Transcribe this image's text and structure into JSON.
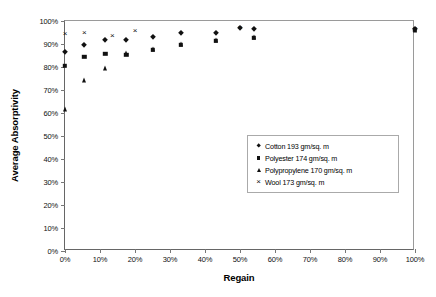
{
  "chart_data": {
    "type": "scatter",
    "title": "",
    "xlabel": "Regain",
    "ylabel": "Average Absorptivity",
    "xlim": [
      0,
      100
    ],
    "ylim": [
      0,
      100
    ],
    "xticks": [
      "0%",
      "10%",
      "20%",
      "30%",
      "40%",
      "50%",
      "60%",
      "70%",
      "80%",
      "90%",
      "100%"
    ],
    "yticks": [
      "0%",
      "10%",
      "20%",
      "30%",
      "40%",
      "50%",
      "60%",
      "70%",
      "80%",
      "90%",
      "100%"
    ],
    "grid": false,
    "legend_position": "center-right",
    "series": [
      {
        "name": "Cotton 193 gm/sq. m",
        "marker": "diamond",
        "color": "#111111",
        "points": [
          {
            "x": 0.0,
            "y": 86.5
          },
          {
            "x": 5.5,
            "y": 89.5
          },
          {
            "x": 11.5,
            "y": 91.8
          },
          {
            "x": 17.5,
            "y": 91.8
          },
          {
            "x": 25.0,
            "y": 93.2
          },
          {
            "x": 33.0,
            "y": 95.0
          },
          {
            "x": 43.0,
            "y": 94.8
          },
          {
            "x": 50.0,
            "y": 96.8
          },
          {
            "x": 54.0,
            "y": 96.6
          },
          {
            "x": 100.0,
            "y": 96.5
          }
        ]
      },
      {
        "name": "Polyester 174 gm/sq. m",
        "marker": "square",
        "color": "#111111",
        "points": [
          {
            "x": 0.0,
            "y": 80.5
          },
          {
            "x": 5.5,
            "y": 84.5
          },
          {
            "x": 11.5,
            "y": 85.8
          },
          {
            "x": 17.5,
            "y": 85.3
          },
          {
            "x": 25.0,
            "y": 87.6
          },
          {
            "x": 33.0,
            "y": 89.6
          },
          {
            "x": 43.0,
            "y": 91.5
          },
          {
            "x": 54.0,
            "y": 92.6
          },
          {
            "x": 100.0,
            "y": 96.2
          }
        ]
      },
      {
        "name": "Polypropylene 170 gm/sq. m",
        "marker": "triangle",
        "color": "#111111",
        "points": [
          {
            "x": 0.0,
            "y": 61.8
          },
          {
            "x": 5.5,
            "y": 74.5
          },
          {
            "x": 11.5,
            "y": 79.5
          },
          {
            "x": 17.5,
            "y": 86.2
          },
          {
            "x": 25.0,
            "y": 87.9
          },
          {
            "x": 33.0,
            "y": 89.9
          },
          {
            "x": 43.0,
            "y": 91.8
          },
          {
            "x": 54.0,
            "y": 93.2
          },
          {
            "x": 100.0,
            "y": 96.0
          }
        ]
      },
      {
        "name": "Wool 173 gm/sq. m",
        "marker": "cross",
        "color": "#111111",
        "points": [
          {
            "x": 0.0,
            "y": 94.5
          },
          {
            "x": 5.5,
            "y": 95.0
          },
          {
            "x": 13.5,
            "y": 93.6
          },
          {
            "x": 20.0,
            "y": 95.6
          },
          {
            "x": 50.0,
            "y": 97.0
          },
          {
            "x": 100.0,
            "y": 96.6
          }
        ]
      }
    ]
  },
  "legend": {
    "entries": [
      {
        "label": "Cotton 193 gm/sq. m",
        "marker": "diamond"
      },
      {
        "label": "Polyester 174 gm/sq. m",
        "marker": "square"
      },
      {
        "label": "Polypropylene 170 gm/sq. m",
        "marker": "triangle"
      },
      {
        "label": "Wool 173 gm/sq. m",
        "marker": "cross"
      }
    ]
  },
  "colors": {
    "marker": "#111111",
    "axis": "#666666",
    "frame": "#9a9a9a",
    "background": "#ffffff"
  }
}
